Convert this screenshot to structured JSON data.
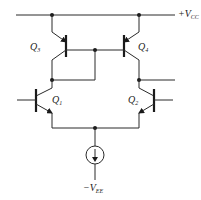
{
  "diagram": {
    "type": "circuit-schematic",
    "supplies": {
      "positive": {
        "main": "+V",
        "sub": "CC"
      },
      "negative": {
        "main": "−V",
        "sub": "EE"
      }
    },
    "transistors": [
      {
        "id": "Q1",
        "main": "Q",
        "sub": "1",
        "type": "npn",
        "role": "differential input (left)"
      },
      {
        "id": "Q2",
        "main": "Q",
        "sub": "2",
        "type": "npn",
        "role": "differential input (right)"
      },
      {
        "id": "Q3",
        "main": "Q",
        "sub": "3",
        "type": "pnp",
        "role": "current mirror (diode-connected)"
      },
      {
        "id": "Q4",
        "main": "Q",
        "sub": "4",
        "type": "pnp",
        "role": "current mirror (output)"
      }
    ],
    "current_source": {
      "id": "I_EE",
      "direction": "down",
      "connects": [
        "emitter-bus",
        "-VEE"
      ]
    },
    "colors": {
      "line": "#2a2a2a",
      "background": "#ffffff"
    }
  }
}
